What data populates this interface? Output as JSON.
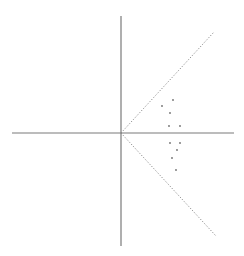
{
  "diagram": {
    "width": 244,
    "height": 256,
    "background": "#ffffff",
    "axis_color": "#7a7a7a",
    "ray_color": "#8a8a8a",
    "dot_color": "#6f6f6f",
    "origin": {
      "x": 121,
      "y": 133
    },
    "x_axis": {
      "x1": 12,
      "y1": 133,
      "x2": 234,
      "y2": 133
    },
    "y_axis": {
      "x1": 121,
      "y1": 16,
      "x2": 121,
      "y2": 246
    },
    "rays": [
      {
        "name": "upper-ray",
        "x1": 121,
        "y1": 133,
        "x2": 214,
        "y2": 32,
        "style": "dotted"
      },
      {
        "name": "lower-ray",
        "x1": 121,
        "y1": 133,
        "x2": 216,
        "y2": 236,
        "style": "dotted"
      }
    ],
    "points": [
      {
        "x": 173,
        "y": 100
      },
      {
        "x": 162,
        "y": 106
      },
      {
        "x": 170,
        "y": 113
      },
      {
        "x": 169,
        "y": 126
      },
      {
        "x": 180,
        "y": 126
      },
      {
        "x": 170,
        "y": 143
      },
      {
        "x": 180,
        "y": 143
      },
      {
        "x": 177,
        "y": 150
      },
      {
        "x": 172,
        "y": 158
      },
      {
        "x": 176,
        "y": 170
      }
    ]
  }
}
